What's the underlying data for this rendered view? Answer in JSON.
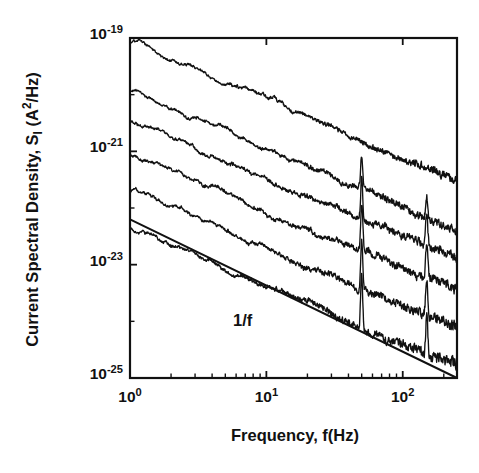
{
  "figure": {
    "background_color": "#ffffff",
    "line_color": "#111111",
    "width": 479,
    "height": 473
  },
  "axes": {
    "x_label_prefix": "Frequency, f(Hz)",
    "y_label_part1": "Current Spectral Density, S",
    "y_label_sub": "I",
    "y_label_part2": " (A",
    "y_label_sup": "2",
    "y_label_part3": "/Hz)",
    "x_ticks": [
      {
        "label_mantissa": "10",
        "label_exp": "0",
        "value": 1
      },
      {
        "label_mantissa": "10",
        "label_exp": "1",
        "value": 10
      },
      {
        "label_mantissa": "10",
        "label_exp": "2",
        "value": 100
      }
    ],
    "y_ticks": [
      {
        "label_mantissa": "10",
        "label_exp": "-19",
        "value": 1e-19
      },
      {
        "label_mantissa": "10",
        "label_exp": "-21",
        "value": 1e-21
      },
      {
        "label_mantissa": "10",
        "label_exp": "-23",
        "value": 1e-23
      },
      {
        "label_mantissa": "10",
        "label_exp": "-25",
        "value": 1e-25
      }
    ]
  },
  "annotations": [
    {
      "text": "1/f",
      "x_px": 233,
      "y_px": 311
    }
  ],
  "chart_data": {
    "type": "line",
    "title": "",
    "xlabel": "Frequency, f(Hz)",
    "ylabel": "Current Spectral Density, S_I (A^2/Hz)",
    "xscale": "log",
    "yscale": "log",
    "xlim": [
      1,
      250
    ],
    "ylim": [
      1e-25,
      1e-19
    ],
    "grid": false,
    "legend": "none",
    "reference_line": {
      "name": "1/f",
      "slope_decades_per_decade": -1,
      "start": {
        "x": 1,
        "y": 6.3e-23
      },
      "end": {
        "x": 250,
        "y": 1e-25
      }
    },
    "spikes": [
      {
        "frequency_hz": 50,
        "label": "mains-50hz"
      },
      {
        "frequency_hz": 150,
        "label": "mains-150hz"
      }
    ],
    "series": [
      {
        "name": "trace-1",
        "start_value": 8.3e-20,
        "end_value": 3e-22,
        "slope_decades_per_decade": -1.02,
        "noise_amplitude": 0.055,
        "spike_height_decades": 0.0
      },
      {
        "name": "trace-2",
        "start_value": 1.2e-20,
        "end_value": 4.2e-23,
        "slope_decades_per_decade": -1.02,
        "noise_amplitude": 0.06,
        "spike_height_decades": 0.55
      },
      {
        "name": "trace-3",
        "start_value": 3.4e-21,
        "end_value": 1.2e-23,
        "slope_decades_per_decade": -1.02,
        "noise_amplitude": 0.065,
        "spike_height_decades": 0.75
      },
      {
        "name": "trace-4",
        "start_value": 9e-22,
        "end_value": 3.2e-24,
        "slope_decades_per_decade": -1.02,
        "noise_amplitude": 0.07,
        "spike_height_decades": 0.85
      },
      {
        "name": "trace-5",
        "start_value": 2.2e-22,
        "end_value": 8e-25,
        "slope_decades_per_decade": -1.02,
        "noise_amplitude": 0.075,
        "spike_height_decades": 0.95
      },
      {
        "name": "trace-6",
        "start_value": 4.6e-23,
        "end_value": 1.7e-25,
        "slope_decades_per_decade": -1.02,
        "noise_amplitude": 0.08,
        "spike_height_decades": 1.0
      }
    ]
  }
}
